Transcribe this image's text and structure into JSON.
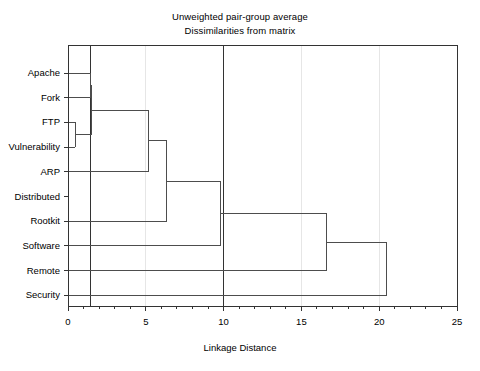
{
  "chart_data": {
    "type": "dendrogram",
    "title": "Unweighted pair-group average",
    "subtitle": "Dissimilarities from matrix",
    "xlabel": "Linkage Distance",
    "ylabel": "",
    "xlim": [
      0,
      25
    ],
    "xticks": [
      0,
      5,
      10,
      15,
      20,
      25
    ],
    "xtick_labels": [
      "0",
      "5",
      "10",
      "15",
      "20",
      "25"
    ],
    "minor_ticks_per_interval": 5,
    "grid": "vertical-light",
    "leaves": [
      "Apache",
      "Fork",
      "FTP",
      "Vulnerability",
      "ARP",
      "Distributed",
      "Rootkit",
      "Software",
      "Remote",
      "Security"
    ],
    "merges": [
      {
        "id": "m1",
        "label": "FTP + Vulnerability",
        "distance": 0.45,
        "children": [
          "FTP",
          "Vulnerability"
        ]
      },
      {
        "id": "m2",
        "label": "Apache + Fork",
        "distance": 1.45,
        "children": [
          "Apache",
          "Fork"
        ]
      },
      {
        "id": "m3",
        "label": "(Apache,Fork) + (FTP,Vuln)",
        "distance": 1.5,
        "children": [
          "m2",
          "m1"
        ]
      },
      {
        "id": "m4",
        "label": "cluster + (ARP,Distributed)",
        "distance": 5.2,
        "children": [
          "m3",
          "ARP"
        ]
      },
      {
        "id": "m5",
        "label": "cluster + Rootkit",
        "distance": 6.35,
        "children": [
          "m4",
          "Rootkit"
        ]
      },
      {
        "id": "m6",
        "label": "cluster + Software",
        "distance": 9.8,
        "children": [
          "m5",
          "Software"
        ]
      },
      {
        "id": "m7",
        "label": "cluster + Remote",
        "distance": 16.6,
        "children": [
          "m6",
          "Remote"
        ]
      },
      {
        "id": "m8",
        "label": "cluster + Security",
        "distance": 20.5,
        "children": [
          "m7",
          "Security"
        ]
      }
    ],
    "emphasized_gridlines": [
      1.45,
      10.0
    ],
    "line_color": "#4d4d4d",
    "axis_color": "#333333",
    "grid_color": "#e6e6e6",
    "background": "#ffffff"
  }
}
